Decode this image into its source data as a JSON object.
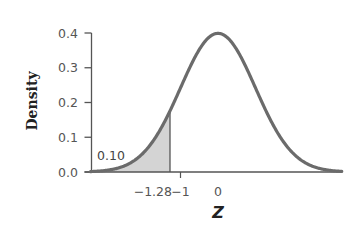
{
  "chart_data": {
    "type": "area",
    "title": "",
    "distribution": "standard normal",
    "xlabel": "Z",
    "ylabel": "Density",
    "xlim": [
      -3.4,
      3.3
    ],
    "ylim": [
      0,
      0.4
    ],
    "grid": false,
    "legend": null,
    "y_ticks": [
      {
        "value": 0.0,
        "label": "0.0"
      },
      {
        "value": 0.1,
        "label": "0.1"
      },
      {
        "value": 0.2,
        "label": "0.2"
      },
      {
        "value": 0.3,
        "label": "0.3"
      },
      {
        "value": 0.4,
        "label": "0.4"
      }
    ],
    "x_ticks": [
      {
        "value": -1.28,
        "label": "−1.28",
        "tick_mark": false
      },
      {
        "value": -1,
        "label": "−1",
        "tick_mark": true
      },
      {
        "value": 0,
        "label": "0",
        "tick_mark": false
      }
    ],
    "shaded_region": {
      "from": -3.4,
      "to": -1.28,
      "area": 0.1,
      "label": "0.10"
    },
    "curve_points": {
      "x": [
        -3,
        -2.5,
        -2,
        -1.5,
        -1.28,
        -1,
        -0.5,
        0,
        0.5,
        1,
        1.5,
        2,
        2.5,
        3
      ],
      "y": [
        0.004,
        0.018,
        0.054,
        0.13,
        0.175,
        0.242,
        0.352,
        0.399,
        0.352,
        0.242,
        0.13,
        0.054,
        0.018,
        0.004
      ]
    },
    "colors": {
      "curve": "#6b6b6b",
      "shade": "#d4d4d4",
      "axis": "#555555"
    }
  }
}
